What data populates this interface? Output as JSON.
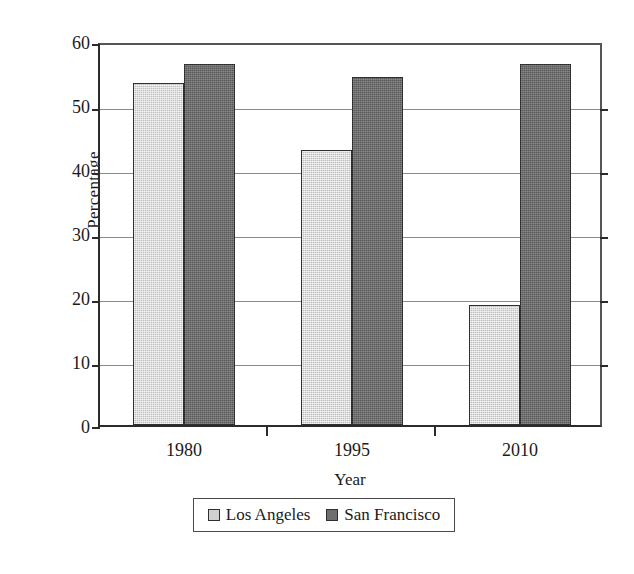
{
  "chart_data": {
    "type": "bar",
    "title": "",
    "subtitle": "",
    "xlabel": "Year",
    "ylabel": "Percentage",
    "categories": [
      "1980",
      "1995",
      "2010"
    ],
    "series": [
      {
        "name": "Los Angeles",
        "values": [
          54,
          43.5,
          19
        ],
        "color": "#d0d0d0"
      },
      {
        "name": "San Francisco",
        "values": [
          57,
          55,
          57
        ],
        "color": "#6f6f6f"
      }
    ],
    "ylim": [
      0,
      60
    ],
    "yticks": [
      0,
      10,
      20,
      30,
      40,
      50,
      60
    ],
    "ytick_labels": [
      "0",
      "10",
      "20",
      "30",
      "40",
      "50",
      "60"
    ],
    "grid": true,
    "grid_axis": "y",
    "legend_position": "bottom"
  },
  "axes": {
    "y_title": "Percentage",
    "x_title": "Year",
    "y_ticks": [
      {
        "label": "60",
        "value": 60
      },
      {
        "label": "50",
        "value": 50
      },
      {
        "label": "40",
        "value": 40
      },
      {
        "label": "30",
        "value": 30
      },
      {
        "label": "20",
        "value": 20
      },
      {
        "label": "10",
        "value": 10
      },
      {
        "label": "0",
        "value": 0
      }
    ],
    "x_ticks": [
      {
        "label": "1980"
      },
      {
        "label": "1995"
      },
      {
        "label": "2010"
      }
    ]
  },
  "legend": {
    "entries": [
      {
        "label": "Los Angeles",
        "swatch": "light-gray-swatch"
      },
      {
        "label": "San Francisco",
        "swatch": "dark-gray-swatch"
      }
    ]
  }
}
